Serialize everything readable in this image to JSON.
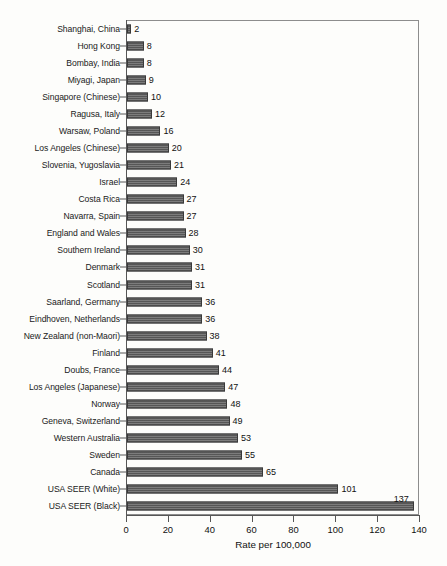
{
  "chart_data": {
    "type": "bar",
    "orientation": "horizontal",
    "title": "",
    "xlabel": "Rate per 100,000",
    "ylabel": "",
    "xlim": [
      0,
      140
    ],
    "xticks": [
      0,
      20,
      40,
      60,
      80,
      100,
      120,
      140
    ],
    "grid": false,
    "legend": null,
    "value_labels": true,
    "bar_color": "#636363",
    "bar_border_color": "#3a3a3a",
    "background_color": "#fdfdfb",
    "axis_color": "#565656",
    "categories": [
      "Shanghai, China",
      "Hong Kong",
      "Bombay, India",
      "Miyagi, Japan",
      "Singapore (Chinese)",
      "Ragusa, Italy",
      "Warsaw, Poland",
      "Los Angeles (Chinese)",
      "Slovenia, Yugoslavia",
      "Israel",
      "Costa Rica",
      "Navarra, Spain",
      "England and Wales",
      "Southern Ireland",
      "Denmark",
      "Scotland",
      "Saarland, Germany",
      "Eindhoven, Netherlands",
      "New Zealand (non-Maori)",
      "Finland",
      "Doubs, France",
      "Los Angeles (Japanese)",
      "Norway",
      "Geneva, Switzerland",
      "Western Australia",
      "Sweden",
      "Canada",
      "USA SEER (White)",
      "USA SEER (Black)"
    ],
    "values": [
      2,
      8,
      8,
      9,
      10,
      12,
      16,
      20,
      21,
      24,
      27,
      27,
      28,
      30,
      31,
      31,
      36,
      36,
      38,
      41,
      44,
      47,
      48,
      49,
      53,
      55,
      65,
      101,
      137
    ]
  }
}
